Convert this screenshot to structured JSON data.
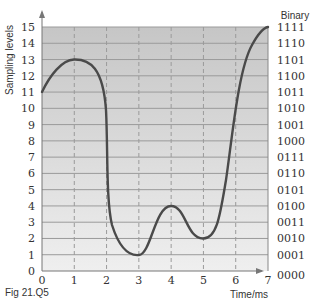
{
  "chart_data": {
    "type": "line",
    "title": "",
    "caption": "Fig 21.Q5",
    "xlabel": "Time/ms",
    "ylabel": "Sampling levels",
    "y2label": "Binary",
    "xlim": [
      0,
      7
    ],
    "ylim": [
      0,
      15
    ],
    "grid": true,
    "x_ticks": [
      "0",
      "1",
      "2",
      "3",
      "4",
      "5",
      "6",
      "7"
    ],
    "y_ticks": [
      "0",
      "1",
      "2",
      "3",
      "4",
      "5",
      "6",
      "7",
      "8",
      "9",
      "10",
      "11",
      "12",
      "13",
      "14",
      "15"
    ],
    "y2_ticks": [
      "0000",
      "0001",
      "0010",
      "0011",
      "0100",
      "0101",
      "0110",
      "0111",
      "1000",
      "1001",
      "1010",
      "1011",
      "1100",
      "1101",
      "1110",
      "1111"
    ],
    "series": [
      {
        "name": "analogue signal",
        "x": [
          0,
          1,
          2,
          3,
          4,
          5,
          6,
          7
        ],
        "y": [
          11,
          13,
          8,
          1,
          4,
          2,
          10,
          15
        ]
      }
    ]
  },
  "labels": {
    "caption": "Fig 21.Q5",
    "xlabel": "Time/ms",
    "ylabel": "Sampling levels",
    "binary": "Binary"
  },
  "colors": {
    "curve": "#4a4a4a",
    "bg_top": "#c6c6c6",
    "bg_bottom": "#efefef",
    "grid": "#9a9a9a"
  }
}
